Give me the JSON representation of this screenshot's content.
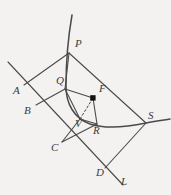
{
  "figure": {
    "background_color": "#f3f2f1",
    "stroke_color": "#4a4a4a",
    "label_color": "#3a3a3a",
    "point_marker_color": "#111111"
  },
  "labels": {
    "A": "A",
    "B": "B",
    "C": "C",
    "D": "D",
    "L": "L",
    "P": "P",
    "Q": "Q",
    "R": "R",
    "S": "S",
    "V": "V",
    "F": "F"
  },
  "label_positions": {
    "A": {
      "x": 13,
      "y": 91
    },
    "B": {
      "x": 24,
      "y": 111
    },
    "C": {
      "x": 51,
      "y": 148
    },
    "D": {
      "x": 96,
      "y": 173
    },
    "L": {
      "x": 120,
      "y": 179
    },
    "P": {
      "x": 75,
      "y": 44
    },
    "Q": {
      "x": 58,
      "y": 81
    },
    "R": {
      "x": 94,
      "y": 131
    },
    "S": {
      "x": 148,
      "y": 115
    },
    "V": {
      "x": 75,
      "y": 124
    },
    "F": {
      "x": 100,
      "y": 90
    }
  },
  "geometry": {
    "points": {
      "A": {
        "x": 24,
        "y": 85
      },
      "B": {
        "x": 36,
        "y": 105
      },
      "C": {
        "x": 62,
        "y": 142
      },
      "D": {
        "x": 105,
        "y": 168
      },
      "L_end": {
        "x": 123,
        "y": 185
      },
      "diagonal_start": {
        "x": 8,
        "y": 62
      },
      "P": {
        "x": 69,
        "y": 53
      },
      "Q": {
        "x": 65,
        "y": 89
      },
      "R": {
        "x": 97,
        "y": 124
      },
      "S": {
        "x": 146,
        "y": 123
      },
      "V": {
        "x": 80,
        "y": 119
      },
      "F": {
        "x": 93,
        "y": 98
      },
      "Pright": {
        "x": 125,
        "y": 84
      },
      "curve_top": {
        "x": 72,
        "y": 15
      },
      "curve_right": {
        "x": 170,
        "y": 119
      }
    },
    "segments": [
      {
        "name": "axis-line-A-L",
        "from": "diagonal_start",
        "to": "L_end"
      },
      {
        "name": "segment-A-P",
        "from": "A",
        "to": "P"
      },
      {
        "name": "segment-P-Q",
        "from": "P",
        "to": "Q"
      },
      {
        "name": "segment-B-Q",
        "from": "B",
        "to": "Q"
      },
      {
        "name": "segment-Q-F",
        "from": "Q",
        "to": "F"
      },
      {
        "name": "segment-P-S",
        "from": "P",
        "to": "S"
      },
      {
        "name": "segment-F-R",
        "from": "F",
        "to": "R"
      },
      {
        "name": "segment-Q-V",
        "from": "Q",
        "to": "V"
      },
      {
        "name": "segment-V-R",
        "from": "V",
        "to": "R"
      },
      {
        "name": "segment-C-V",
        "from": "C",
        "to": "V"
      },
      {
        "name": "segment-C-R",
        "from": "C",
        "to": "R"
      },
      {
        "name": "segment-D-S",
        "from": "D",
        "to": "S"
      },
      {
        "name": "segment-R-S",
        "from": "R",
        "to": "S"
      }
    ],
    "dashed_segments": [
      {
        "name": "dashed-segment-V-F",
        "from": "V",
        "to": "F"
      }
    ],
    "markers": [
      {
        "name": "point-marker-F",
        "at": "F",
        "style": "filled-square"
      }
    ],
    "curves": [
      {
        "name": "conic-curve",
        "through": [
          "curve_top",
          "P",
          "Q",
          "R",
          "S",
          "curve_right"
        ]
      }
    ]
  }
}
